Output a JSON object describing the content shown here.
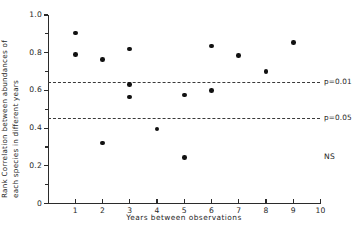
{
  "chart_data": {
    "type": "scatter",
    "title": "",
    "xlabel": "Years between observations",
    "ylabel_line1": "Rank Correlation between abundances of",
    "ylabel_line2": "each species in different years",
    "xlim": [
      0,
      10
    ],
    "ylim": [
      0,
      1.0
    ],
    "grid": false,
    "legend": "none",
    "xticks": [
      "1",
      "2",
      "3",
      "4",
      "5",
      "6",
      "7",
      "8",
      "9",
      "10"
    ],
    "xtick_values": [
      1,
      2,
      3,
      4,
      5,
      6,
      7,
      8,
      9,
      10
    ],
    "yticks": [
      "0",
      "0.2",
      "0.4",
      "0.6",
      "0.8",
      "1.0"
    ],
    "ytick_values": [
      0,
      0.2,
      0.4,
      0.6,
      0.8,
      1.0
    ],
    "ytick_minor_values": [
      0.1,
      0.3,
      0.5,
      0.7,
      0.9
    ],
    "points": [
      {
        "x": 1,
        "y": 0.905
      },
      {
        "x": 1,
        "y": 0.79
      },
      {
        "x": 2,
        "y": 0.765
      },
      {
        "x": 2,
        "y": 0.32
      },
      {
        "x": 3,
        "y": 0.82
      },
      {
        "x": 3,
        "y": 0.63
      },
      {
        "x": 3,
        "y": 0.565
      },
      {
        "x": 4,
        "y": 0.395
      },
      {
        "x": 5,
        "y": 0.575
      },
      {
        "x": 5,
        "y": 0.245
      },
      {
        "x": 6,
        "y": 0.835
      },
      {
        "x": 6,
        "y": 0.6
      },
      {
        "x": 7,
        "y": 0.785
      },
      {
        "x": 8,
        "y": 0.7
      },
      {
        "x": 9,
        "y": 0.855
      }
    ],
    "threshold_lines": [
      {
        "label": "p=0.01",
        "y": 0.645,
        "style": "dashed"
      },
      {
        "label": "p=0.05",
        "y": 0.455,
        "style": "dashed"
      }
    ],
    "annotations": [
      {
        "text": "NS",
        "x": 9.9,
        "y": 0.27
      }
    ],
    "colors": {
      "marker": "#111111",
      "axis": "#2b2b2b",
      "threshold": "#3a3a3a",
      "text": "#262626",
      "background": "#ffffff"
    }
  }
}
